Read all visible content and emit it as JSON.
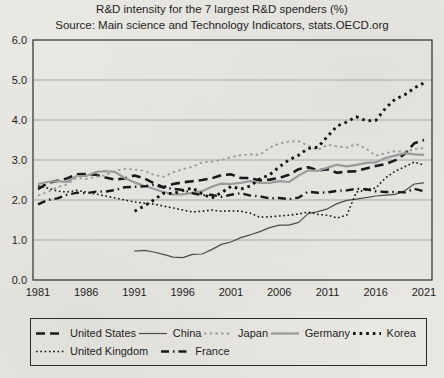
{
  "chart_data": {
    "type": "line",
    "title": "R&D intensity for the 7 largest R&D spenders (%)",
    "subtitle": "Source: Main science and Technology Indicators, stats.OECD.org",
    "xlabel": "",
    "ylabel": "",
    "xlim": [
      1981,
      2021
    ],
    "ylim": [
      0.0,
      6.0
    ],
    "grid": "horizontal",
    "x_ticks": [
      1981,
      1986,
      1991,
      1996,
      2001,
      2006,
      2011,
      2016,
      2021
    ],
    "x_tick_labels": [
      "1981",
      "1986",
      "1991",
      "1996",
      "2001",
      "2006",
      "2011",
      "2016",
      "2021"
    ],
    "y_ticks": [
      0,
      1,
      2,
      3,
      4,
      5,
      6
    ],
    "y_tick_labels": [
      "0.0",
      "1.0",
      "2.0",
      "3.0",
      "4.0",
      "5.0",
      "6.0"
    ],
    "legend": {
      "position": "bottom-box",
      "rows": [
        [
          "United States",
          "China",
          "Japan",
          "Germany",
          "Korea"
        ],
        [
          "United Kingdom",
          "France"
        ]
      ]
    },
    "series": [
      {
        "name": "United States",
        "style": "bold-dash",
        "color": "#1a1a1a",
        "start_year": 1981,
        "values": [
          2.27,
          2.42,
          2.48,
          2.54,
          2.64,
          2.65,
          2.63,
          2.56,
          2.51,
          2.54,
          2.61,
          2.54,
          2.42,
          2.32,
          2.4,
          2.44,
          2.47,
          2.5,
          2.54,
          2.62,
          2.64,
          2.55,
          2.55,
          2.49,
          2.51,
          2.55,
          2.63,
          2.77,
          2.82,
          2.74,
          2.77,
          2.68,
          2.71,
          2.72,
          2.79,
          2.85,
          2.9,
          2.99,
          3.15,
          3.42,
          3.5
        ]
      },
      {
        "name": "China",
        "style": "thin-solid",
        "color": "#4d4d4d",
        "start_year": 1991,
        "values": [
          0.72,
          0.74,
          0.7,
          0.64,
          0.57,
          0.56,
          0.64,
          0.65,
          0.76,
          0.89,
          0.95,
          1.06,
          1.13,
          1.21,
          1.31,
          1.37,
          1.37,
          1.44,
          1.66,
          1.71,
          1.78,
          1.91,
          1.99,
          2.02,
          2.06,
          2.1,
          2.12,
          2.14,
          2.23,
          2.4,
          2.43
        ]
      },
      {
        "name": "Japan",
        "style": "gray-dotted",
        "color": "#9a9a9a",
        "start_year": 1981,
        "values": [
          2.11,
          2.2,
          2.32,
          2.39,
          2.55,
          2.53,
          2.58,
          2.62,
          2.73,
          2.78,
          2.76,
          2.73,
          2.63,
          2.58,
          2.69,
          2.77,
          2.83,
          2.94,
          2.96,
          3.0,
          3.07,
          3.12,
          3.14,
          3.13,
          3.31,
          3.41,
          3.46,
          3.47,
          3.36,
          3.25,
          3.38,
          3.34,
          3.31,
          3.4,
          3.28,
          3.11,
          3.17,
          3.22,
          3.2,
          3.27,
          3.3
        ]
      },
      {
        "name": "Germany",
        "style": "gray-solid",
        "color": "#9a9a9a",
        "start_year": 1981,
        "values": [
          2.4,
          2.45,
          2.47,
          2.45,
          2.6,
          2.6,
          2.7,
          2.72,
          2.7,
          2.55,
          2.44,
          2.35,
          2.28,
          2.2,
          2.14,
          2.14,
          2.18,
          2.22,
          2.33,
          2.41,
          2.4,
          2.43,
          2.47,
          2.43,
          2.43,
          2.47,
          2.45,
          2.61,
          2.74,
          2.73,
          2.81,
          2.88,
          2.84,
          2.88,
          2.93,
          2.94,
          3.05,
          3.11,
          3.17,
          3.14,
          3.13
        ]
      },
      {
        "name": "Korea",
        "style": "bold-dotted",
        "color": "#111111",
        "start_year": 1991,
        "values": [
          1.72,
          1.85,
          2.0,
          2.17,
          2.16,
          2.24,
          2.3,
          2.15,
          2.05,
          2.18,
          2.34,
          2.27,
          2.35,
          2.53,
          2.63,
          2.83,
          3.0,
          3.12,
          3.29,
          3.32,
          3.59,
          3.85,
          3.95,
          4.08,
          3.98,
          3.99,
          4.29,
          4.52,
          4.63,
          4.8,
          4.93
        ]
      },
      {
        "name": "United Kingdom",
        "style": "fine-dotted",
        "color": "#1a1a1a",
        "start_year": 1981,
        "values": [
          2.35,
          2.3,
          2.22,
          2.2,
          2.24,
          2.2,
          2.15,
          2.1,
          2.05,
          2.0,
          1.95,
          1.92,
          1.9,
          1.85,
          1.8,
          1.75,
          1.7,
          1.72,
          1.75,
          1.72,
          1.73,
          1.72,
          1.67,
          1.57,
          1.58,
          1.6,
          1.62,
          1.65,
          1.7,
          1.64,
          1.62,
          1.55,
          1.62,
          2.2,
          2.25,
          2.3,
          2.55,
          2.72,
          2.83,
          2.95,
          2.87
        ]
      },
      {
        "name": "France",
        "style": "dash-dot",
        "color": "#1a1a1a",
        "start_year": 1981,
        "values": [
          1.89,
          2.0,
          2.04,
          2.13,
          2.18,
          2.17,
          2.21,
          2.21,
          2.25,
          2.32,
          2.33,
          2.34,
          2.38,
          2.31,
          2.28,
          2.25,
          2.17,
          2.12,
          2.13,
          2.08,
          2.13,
          2.17,
          2.11,
          2.09,
          2.04,
          2.05,
          2.02,
          2.06,
          2.21,
          2.18,
          2.19,
          2.23,
          2.24,
          2.28,
          2.27,
          2.22,
          2.2,
          2.2,
          2.19,
          2.28,
          2.22
        ]
      }
    ]
  }
}
